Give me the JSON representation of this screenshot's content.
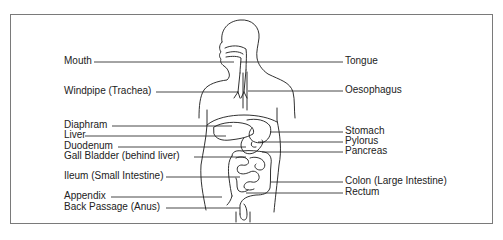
{
  "diagram": {
    "left_labels": [
      {
        "text": "Mouth",
        "x": 64,
        "y": 55
      },
      {
        "text": "Windpipe (Trachea)",
        "x": 64,
        "y": 85
      },
      {
        "text": "Diaphram",
        "x": 64,
        "y": 119
      },
      {
        "text": "Liver",
        "x": 64,
        "y": 129
      },
      {
        "text": "Duodenum",
        "x": 64,
        "y": 140
      },
      {
        "text": "Gall Bladder (behind liver)",
        "x": 64,
        "y": 150
      },
      {
        "text": "Ileum (Small Intestine)",
        "x": 64,
        "y": 170
      },
      {
        "text": "Appendix",
        "x": 64,
        "y": 190
      },
      {
        "text": "Back Passage (Anus)",
        "x": 64,
        "y": 201
      }
    ],
    "right_labels": [
      {
        "text": "Tongue",
        "x": 345,
        "y": 55
      },
      {
        "text": "Oesophagus",
        "x": 345,
        "y": 84
      },
      {
        "text": "Stomach",
        "x": 345,
        "y": 125
      },
      {
        "text": "Pylorus",
        "x": 345,
        "y": 135
      },
      {
        "text": "Pancreas",
        "x": 345,
        "y": 145
      },
      {
        "text": "Colon (Large Intestine)",
        "x": 345,
        "y": 175
      },
      {
        "text": "Rectum",
        "x": 345,
        "y": 186
      }
    ]
  }
}
